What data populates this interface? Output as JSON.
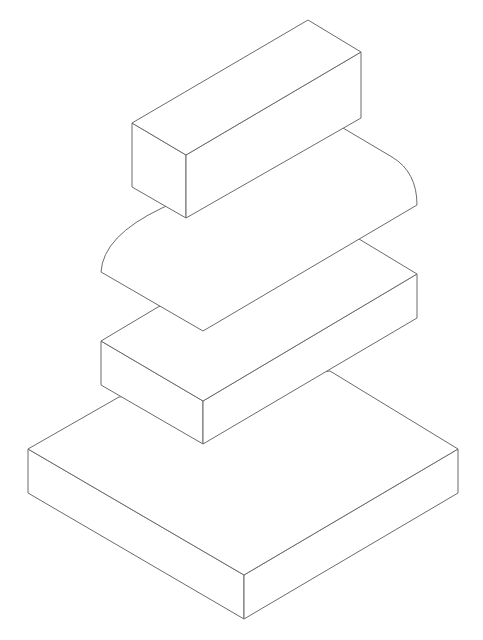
{
  "diagram": {
    "type": "isometric-line-drawing",
    "background": "#ffffff",
    "stroke_color": "#6b6b6b",
    "parts": [
      {
        "name": "top-rectangular-block",
        "top_face": [
          [
            132,
            123
          ],
          [
            308,
            20
          ],
          [
            361,
            52
          ],
          [
            186,
            155
          ]
        ],
        "left_face": [
          [
            132,
            123
          ],
          [
            186,
            155
          ],
          [
            186,
            218
          ],
          [
            132,
            187
          ]
        ],
        "right_face": [
          [
            186,
            155
          ],
          [
            361,
            52
          ],
          [
            361,
            118
          ],
          [
            186,
            218
          ]
        ]
      },
      {
        "name": "rounded-slab",
        "outline_path": "M 162 208 L 343 128 L 392 157 Q 417 172 417 205 L 203 331 L 101 272 Q 103 236 162 208 Z"
      },
      {
        "name": "middle-rectangular-block",
        "top_face": [
          [
            101,
            341
          ],
          [
            158,
            307
          ],
          [
            359,
            239
          ],
          [
            417,
            274
          ],
          [
            203,
            401
          ]
        ],
        "left_face": [
          [
            101,
            341
          ],
          [
            203,
            401
          ],
          [
            203,
            444
          ],
          [
            101,
            385
          ]
        ],
        "right_face": [
          [
            203,
            401
          ],
          [
            417,
            274
          ],
          [
            417,
            318
          ],
          [
            203,
            444
          ]
        ]
      },
      {
        "name": "base-plate",
        "top_face": [
          [
            28,
            449
          ],
          [
            119,
            397
          ],
          [
            330,
            371
          ],
          [
            458,
            449
          ],
          [
            244,
            575
          ]
        ],
        "left_face": [
          [
            28,
            449
          ],
          [
            244,
            575
          ],
          [
            244,
            619
          ],
          [
            28,
            493
          ]
        ],
        "right_face": [
          [
            244,
            575
          ],
          [
            458,
            449
          ],
          [
            458,
            493
          ],
          [
            244,
            619
          ]
        ]
      }
    ]
  }
}
